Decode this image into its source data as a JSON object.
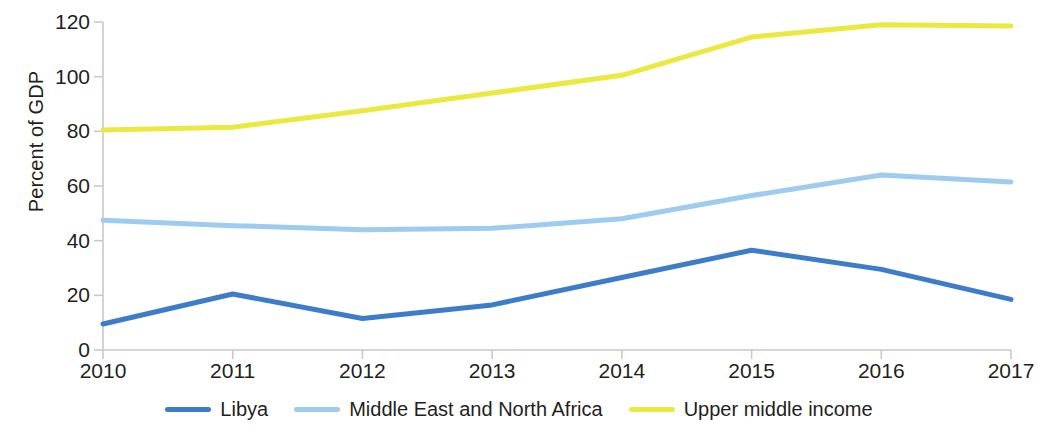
{
  "chart_data": {
    "type": "line",
    "title": "",
    "xlabel": "",
    "ylabel": "Percent of GDP",
    "x": [
      2010,
      2011,
      2012,
      2013,
      2014,
      2015,
      2016,
      2017
    ],
    "xtick_labels": [
      "2010",
      "2011",
      "2012",
      "2013",
      "2014",
      "2015",
      "2016",
      "2017"
    ],
    "ytick_labels": [
      "0",
      "20",
      "40",
      "60",
      "80",
      "100",
      "120"
    ],
    "yticks": [
      0,
      20,
      40,
      60,
      80,
      100,
      120
    ],
    "ylim": [
      0,
      120
    ],
    "xlim": [
      2010,
      2017
    ],
    "grid": false,
    "legend_position": "bottom",
    "series": [
      {
        "name": "Libya",
        "color": "#3d7cc9",
        "values": [
          9.5,
          20.5,
          11.5,
          16.5,
          26.5,
          36.5,
          29.5,
          18.5
        ]
      },
      {
        "name": "Middle East and North Africa",
        "color": "#9ecbf0",
        "values": [
          47.5,
          45.5,
          44,
          44.5,
          48,
          56.5,
          64,
          61.5
        ]
      },
      {
        "name": "Upper middle income",
        "color": "#ebe940",
        "values": [
          80.5,
          81.5,
          87.5,
          94,
          100.5,
          114.5,
          119,
          118.5
        ]
      }
    ]
  },
  "axis": {
    "y_title": "Percent of GDP",
    "axis_color": "#c9c9c9"
  },
  "legend": {
    "items": [
      {
        "label": "Libya",
        "color": "#3d7cc9",
        "swatch": "line-swatch"
      },
      {
        "label": "Middle East and North Africa",
        "color": "#9ecbf0",
        "swatch": "line-swatch"
      },
      {
        "label": "Upper middle income",
        "color": "#ebe940",
        "swatch": "line-swatch"
      }
    ]
  }
}
